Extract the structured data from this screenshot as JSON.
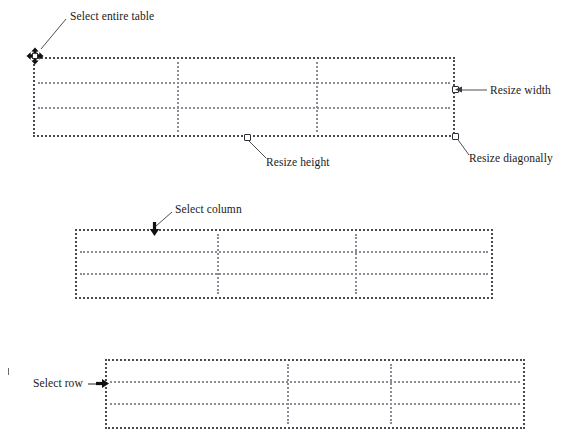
{
  "figure": {
    "background_color": "#ffffff",
    "ink_color": "#1a1a1a",
    "table_border_color": "#4a4a52",
    "table_gridline_color": "#8d8d97"
  },
  "labels": {
    "select_entire_table": "Select entire table",
    "resize_width": "Resize width",
    "resize_height": "Resize height",
    "resize_diagonally": "Resize diagonally",
    "select_column": "Select column",
    "select_row": "Select row"
  },
  "tables": [
    {
      "id": "table-top",
      "name": "table-entire-selection",
      "x": 33,
      "y": 57,
      "width": 422,
      "height": 80,
      "column_dividers": [
        142,
        281
      ],
      "row_dividers": [
        23,
        48
      ],
      "handles": [
        {
          "name": "move-table-handle",
          "type": "move",
          "position": "top-left"
        },
        {
          "name": "resize-width-handle",
          "type": "square",
          "position": "right-middle"
        },
        {
          "name": "resize-height-handle",
          "type": "square",
          "position": "bottom-center"
        },
        {
          "name": "resize-diagonal-handle",
          "type": "square",
          "position": "bottom-right"
        }
      ]
    },
    {
      "id": "table-middle",
      "name": "table-column-selection",
      "x": 75,
      "y": 229,
      "width": 418,
      "height": 70,
      "column_dividers": [
        140,
        278
      ],
      "row_dividers": [
        20,
        42
      ],
      "handles": [
        {
          "name": "select-column-arrow",
          "type": "arrow-down",
          "position": "top-column-1"
        }
      ]
    },
    {
      "id": "table-bottom",
      "name": "table-row-selection",
      "x": 105,
      "y": 359,
      "width": 420,
      "height": 70,
      "column_dividers": [
        180,
        283
      ],
      "row_dividers": [
        20,
        42
      ],
      "handles": [
        {
          "name": "select-row-arrow",
          "type": "arrow-right",
          "position": "left-row-2"
        }
      ]
    }
  ]
}
